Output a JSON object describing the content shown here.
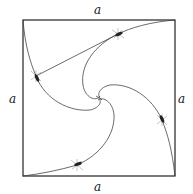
{
  "diagram": {
    "labels": {
      "top": "a",
      "bottom": "a",
      "left": "a",
      "right": "a"
    },
    "square": {
      "x": 23,
      "y": 20,
      "width": 152,
      "height": 156
    },
    "bugs": [
      {
        "name": "bug-top",
        "x": 118,
        "y": 34
      },
      {
        "name": "bug-left",
        "x": 36,
        "y": 76
      },
      {
        "name": "bug-right",
        "x": 162,
        "y": 120
      },
      {
        "name": "bug-bottom",
        "x": 77,
        "y": 165
      }
    ],
    "colors": {
      "line": "#444444",
      "edge": "#222222",
      "background": "#ffffff"
    }
  }
}
